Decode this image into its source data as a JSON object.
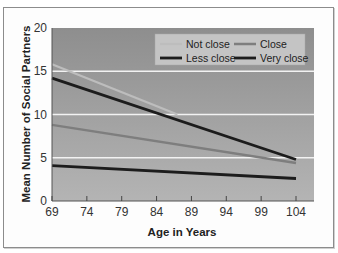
{
  "chart_data": {
    "type": "line",
    "title": "",
    "xlabel": "Age in Years",
    "ylabel": "Mean Number of Social Partners",
    "xlim": [
      69,
      104
    ],
    "ylim": [
      0,
      20
    ],
    "x_ticks": [
      "69",
      "74",
      "79",
      "84",
      "89",
      "94",
      "99",
      "104"
    ],
    "y_ticks": [
      "0",
      "5",
      "10",
      "15",
      "20"
    ],
    "grid": {
      "horizontal": [
        5,
        10,
        15
      ],
      "color": "#f2f2f2"
    },
    "legend_position": "top-right",
    "series": [
      {
        "name": "Not close",
        "color": "#bdbdbd",
        "width": 2.2,
        "x": [
          69,
          87
        ],
        "values": [
          15.8,
          10.0
        ]
      },
      {
        "name": "Close",
        "color": "#7e7e7e",
        "width": 2.5,
        "x": [
          69,
          104
        ],
        "values": [
          8.8,
          4.4
        ]
      },
      {
        "name": "Less close",
        "color": "#1c1c1c",
        "width": 2.8,
        "x": [
          69,
          104
        ],
        "values": [
          14.2,
          4.8
        ]
      },
      {
        "name": "Very close",
        "color": "#1c1c1c",
        "width": 2.8,
        "x": [
          69,
          104
        ],
        "values": [
          4.1,
          2.6
        ]
      }
    ]
  },
  "legend": {
    "items": [
      {
        "label": "Not close"
      },
      {
        "label": "Close"
      },
      {
        "label": "Less close"
      },
      {
        "label": "Very close"
      }
    ]
  }
}
